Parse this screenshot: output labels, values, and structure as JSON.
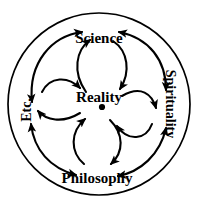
{
  "diagram": {
    "title": "Reality",
    "center": {
      "label": "Reality",
      "marker": "center-dot"
    },
    "nodes": [
      {
        "id": "science",
        "label": "Science",
        "position": "top",
        "orientation": "horizontal"
      },
      {
        "id": "spirituality",
        "label": "Spirituality",
        "position": "right",
        "orientation": "vertical-down"
      },
      {
        "id": "philosophy",
        "label": "Philosophy",
        "position": "bottom",
        "orientation": "horizontal"
      },
      {
        "id": "etc",
        "label": "Etc.",
        "position": "left",
        "orientation": "vertical-up"
      }
    ],
    "relations": [
      {
        "from": "center",
        "to": "science",
        "style": "bidirectional-curve"
      },
      {
        "from": "center",
        "to": "spirituality",
        "style": "bidirectional-curve"
      },
      {
        "from": "center",
        "to": "philosophy",
        "style": "bidirectional-curve"
      },
      {
        "from": "center",
        "to": "etc",
        "style": "bidirectional-curve"
      },
      {
        "from": "science",
        "to": "spirituality",
        "style": "outer-arc-bidirectional"
      },
      {
        "from": "spirituality",
        "to": "philosophy",
        "style": "outer-arc-bidirectional"
      },
      {
        "from": "philosophy",
        "to": "etc",
        "style": "outer-arc-bidirectional"
      },
      {
        "from": "etc",
        "to": "science",
        "style": "outer-arc-bidirectional"
      }
    ],
    "colors": {
      "stroke": "#000000",
      "background": "#ffffff",
      "text": "#000000"
    },
    "border": {
      "shape": "circle",
      "stroke_width": "1.6"
    }
  }
}
